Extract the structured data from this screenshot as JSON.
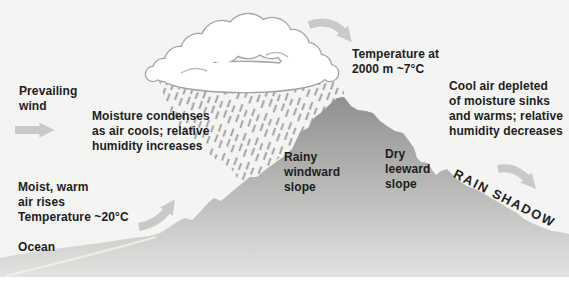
{
  "labels": {
    "prevailing_wind": "Prevailing\nwind",
    "moisture": "Moisture condenses\nas air cools; relative\nhumidity increases",
    "temperature_2000m": "Temperature at\n2000 m ~7°C",
    "cool_air": "Cool air depleted\nof moisture sinks\nand warms; relative\nhumidity decreases",
    "moist_warm_air": "Moist, warm\nair rises\nTemperature ~20°C",
    "ocean": "Ocean",
    "windward_slope": "Rainy\nwindward\nslope",
    "leeward_slope": "Dry\nleeward\nslope",
    "rain_shadow": "RAIN SHADOW"
  },
  "colors": {
    "sky": "#f4f4f2",
    "mountain_peak": "#8f8f8f",
    "mountain_base": "#e4e4e2",
    "rain": "#949494",
    "cloud_outline": "#a3a3a3",
    "arrow": "#c2c2c0",
    "text": "#1d1d1d",
    "shoreline_highlight": "#efefec"
  }
}
